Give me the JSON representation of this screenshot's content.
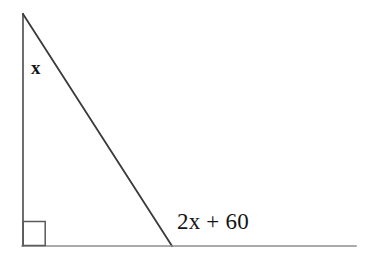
{
  "figure": {
    "background_color": "#ffffff",
    "stroke_color": "#3a3a3a",
    "text_color": "#151515",
    "labels": {
      "interior_apex_angle": "x",
      "exterior_base_angle": "2x + 60"
    },
    "markers": {
      "right_angle_square": "right-angle-marker"
    },
    "geometry": {
      "apex": [
        23,
        14
      ],
      "right_angle_vertex": [
        23,
        246
      ],
      "base_vertex": [
        172,
        246
      ],
      "baseline_end": [
        356,
        246
      ],
      "right_angle_square": [
        22,
        221,
        45,
        246
      ]
    }
  }
}
